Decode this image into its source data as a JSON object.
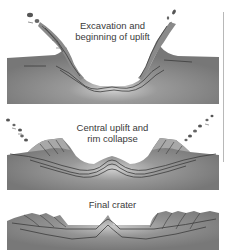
{
  "diagram": {
    "colors": {
      "ground": "#7d7d7d",
      "ground_light": "#c4c4c4",
      "layer_line": "#3c3c3c",
      "background": "#ffffff",
      "text": "#3a3a3a"
    },
    "stages": [
      {
        "id": "excavation",
        "label_line1": "Excavation and",
        "label_line2": "beginning of uplift"
      },
      {
        "id": "uplift",
        "label_line1": "Central uplift and",
        "label_line2": "rim collapse"
      },
      {
        "id": "final",
        "label_line1": "Final crater",
        "label_line2": ""
      }
    ]
  }
}
